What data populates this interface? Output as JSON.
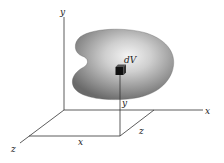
{
  "diagram": {
    "axes": {
      "x_label": "x",
      "y_label": "y",
      "z_label": "z"
    },
    "element": {
      "label": "dV"
    },
    "projection_labels": {
      "x": "x",
      "y": "y",
      "z": "z"
    },
    "colors": {
      "blob_dark": "#6e6e6e",
      "blob_light": "#f2f2f2",
      "lines": "#333333",
      "cube": "#111111"
    }
  }
}
